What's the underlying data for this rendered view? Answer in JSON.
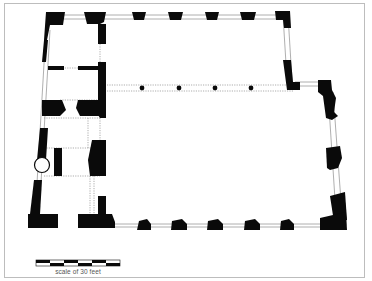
{
  "figure": {
    "type": "architectural floor plan",
    "scale_label": "scale of 30 feet",
    "colors": {
      "wall": "#0a0a0a",
      "frame": "#bdbdbd",
      "window": "#9a9a9a",
      "dotted": "#8a8a8a",
      "background": "#ffffff"
    }
  },
  "plan": {
    "columns": [
      {
        "cx": 142,
        "cy": 88
      },
      {
        "cx": 179,
        "cy": 88
      },
      {
        "cx": 215,
        "cy": 88
      },
      {
        "cx": 251,
        "cy": 88
      }
    ],
    "top_piers_x": [
      132,
      168,
      205,
      240,
      277
    ],
    "bottom_piers_x": [
      143,
      179,
      215,
      252,
      287
    ],
    "scale_bar": {
      "segments": 6,
      "x": 36,
      "y": 260,
      "width": 84,
      "height": 6
    }
  }
}
